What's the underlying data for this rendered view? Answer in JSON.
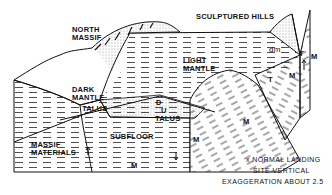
{
  "diagram": {
    "type": "block-diagram",
    "labels": {
      "north_massif": [
        "NORTH",
        "MASSIF"
      ],
      "sculptured_hills": "SCULPTURED HILLS",
      "light_mantle": [
        "LIGHT",
        "MANTLE"
      ],
      "dark_mantle": [
        "DARK",
        "MANTLE"
      ],
      "talus_left": "TALUS",
      "talus_center": "TALUS",
      "d": "D",
      "u": "U",
      "subfloor": "SUBFLOOR",
      "massif_materials": [
        "MASSIF",
        "MATERIALS"
      ],
      "dm": "dm",
      "t_right_top": "T",
      "t_right_mid": "T",
      "m_labels": [
        "M",
        "M",
        "M",
        "M",
        "M"
      ]
    },
    "caption": {
      "line1": "x NORMAL LANDING",
      "line2": "SITE     VERTICAL",
      "line3": "EXAGGERATION ABOUT 2.5"
    },
    "colors": {
      "ink": "#111111",
      "paper": "#ffffff",
      "stipple": "#555555"
    }
  }
}
